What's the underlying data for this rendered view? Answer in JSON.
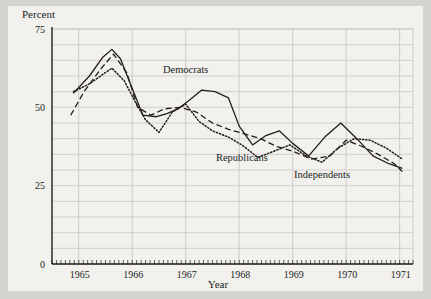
{
  "figure": {
    "background_color": "#d6d4d0",
    "panel_color": "#f2f1ee",
    "ink_color": "#201d1a",
    "grid_color": "#c9c7c2"
  },
  "chart_data": {
    "type": "line",
    "title": "",
    "subtitle": "",
    "xlabel": "Year",
    "ylabel": "Percent",
    "ylabel_position": "top-left",
    "xlim": [
      1964.5,
      1971.25
    ],
    "ylim": [
      0,
      75
    ],
    "yticks": [
      0,
      25,
      50,
      75
    ],
    "ytick_labels": [
      "0",
      "25",
      "50",
      "75"
    ],
    "xticks": [
      1965,
      1966,
      1967,
      1968,
      1969,
      1970,
      1971
    ],
    "xtick_labels": [
      "1965",
      "1966",
      "1967",
      "1968",
      "1969",
      "1970",
      "1971"
    ],
    "minor_xticks_per_year": 12,
    "grid": {
      "horizontal": true,
      "horizontal_step": 5,
      "vertical": true,
      "vertical_step": 1
    },
    "legend": {
      "position": "inline-annotations",
      "entries": [
        "Democrats",
        "Republicans",
        "Independents"
      ]
    },
    "annotations": [
      {
        "text": "Democrats",
        "x": 1967.0,
        "y": 61.0
      },
      {
        "text": "Republicans",
        "x": 1968.05,
        "y": 33.0
      },
      {
        "text": "Independents",
        "x": 1969.55,
        "y": 27.5
      }
    ],
    "series": [
      {
        "name": "Democrats",
        "style": "solid",
        "x": [
          1964.9,
          1965.2,
          1965.45,
          1965.62,
          1965.78,
          1966.0,
          1966.2,
          1966.45,
          1966.65,
          1966.85,
          1967.05,
          1967.3,
          1967.55,
          1967.8,
          1968.0,
          1968.25,
          1968.5,
          1968.75,
          1969.0,
          1969.3,
          1969.6,
          1969.9,
          1970.2,
          1970.5,
          1970.8,
          1971.05
        ],
        "y": [
          54.5,
          60.0,
          66.0,
          68.5,
          65.5,
          56.0,
          47.5,
          47.0,
          48.0,
          49.5,
          52.0,
          55.5,
          55.0,
          53.0,
          44.0,
          38.0,
          41.0,
          42.5,
          38.5,
          34.5,
          40.5,
          45.0,
          40.0,
          34.5,
          32.0,
          30.5
        ]
      },
      {
        "name": "Republicans",
        "style": "dotted",
        "x": [
          1964.9,
          1965.2,
          1965.45,
          1965.62,
          1965.85,
          1966.05,
          1966.25,
          1966.5,
          1966.75,
          1967.0,
          1967.25,
          1967.5,
          1967.8,
          1968.05,
          1968.35,
          1968.65,
          1968.95,
          1969.25,
          1969.55,
          1969.85,
          1970.15,
          1970.45,
          1970.75,
          1971.05
        ],
        "y": [
          55.0,
          57.5,
          60.5,
          62.5,
          58.5,
          52.0,
          46.0,
          42.0,
          48.5,
          51.0,
          45.5,
          42.5,
          40.5,
          38.0,
          34.0,
          36.0,
          38.0,
          34.5,
          32.5,
          37.0,
          40.0,
          39.5,
          37.0,
          33.5
        ]
      },
      {
        "name": "Independents",
        "style": "dashed",
        "x": [
          1964.85,
          1965.1,
          1965.4,
          1965.65,
          1965.9,
          1966.1,
          1966.35,
          1966.6,
          1966.9,
          1967.2,
          1967.5,
          1967.8,
          1968.1,
          1968.4,
          1968.7,
          1969.0,
          1969.35,
          1969.7,
          1970.0,
          1970.3,
          1970.6,
          1970.9,
          1971.05
        ],
        "y": [
          47.5,
          55.0,
          62.0,
          67.0,
          61.0,
          50.0,
          47.5,
          49.5,
          50.0,
          48.5,
          45.0,
          43.0,
          41.5,
          40.0,
          37.5,
          36.0,
          33.5,
          34.5,
          39.5,
          37.5,
          35.0,
          32.0,
          29.5
        ]
      }
    ]
  }
}
